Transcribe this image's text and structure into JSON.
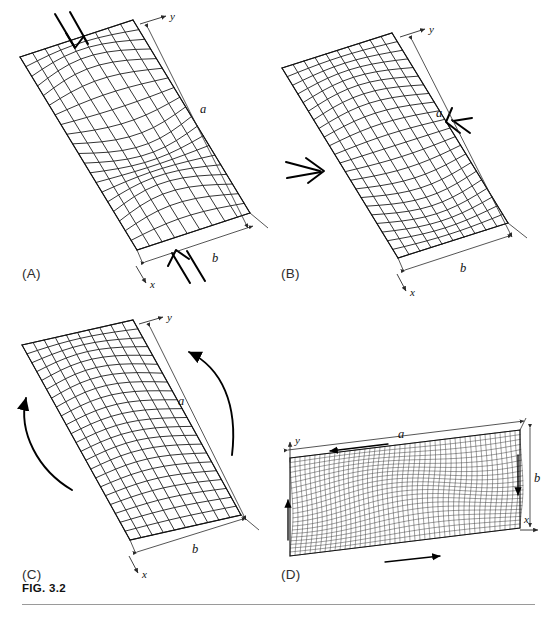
{
  "figure": {
    "caption": "FIG. 3.2",
    "width": 545,
    "height": 618,
    "background": "#ffffff",
    "ink_color": "#111111"
  },
  "panels": [
    {
      "id": "A",
      "tag": "(A)",
      "load_type": "uniaxial-compression",
      "description": "Plate buckling under longitudinal compression with multiple half-waves",
      "dimension_labels": {
        "long_side": "a",
        "short_side": "b"
      },
      "axis_labels": {
        "horizontal": "x",
        "vertical": "y"
      },
      "arrows": [
        {
          "name": "top-compression-arrow",
          "direction": "down-right",
          "style": "double-line"
        },
        {
          "name": "bottom-compression-arrow",
          "direction": "up-left",
          "style": "double-line"
        }
      ],
      "mesh": {
        "cols": 9,
        "rows": 20,
        "halfwaves": 3,
        "amplitude": 13,
        "weight": "medium"
      }
    },
    {
      "id": "B",
      "tag": "(B)",
      "load_type": "transverse-compression",
      "description": "Plate buckling under transverse compression across the width",
      "dimension_labels": {
        "long_side": "a",
        "short_side": "b"
      },
      "axis_labels": {
        "horizontal": "x",
        "vertical": "y"
      },
      "arrows": [
        {
          "name": "left-compression-arrow",
          "direction": "right",
          "style": "double-line"
        },
        {
          "name": "right-compression-arrow",
          "direction": "left",
          "style": "double-line"
        }
      ],
      "mesh": {
        "cols": 10,
        "rows": 22,
        "halfwaves": 2,
        "amplitude": 10,
        "weight": "medium"
      }
    },
    {
      "id": "C",
      "tag": "(C)",
      "load_type": "bending-moment",
      "description": "Plate buckling under in-plane bending with moment couples",
      "dimension_labels": {
        "long_side": "a",
        "short_side": "b"
      },
      "axis_labels": {
        "horizontal": "x",
        "vertical": "y"
      },
      "arrows": [
        {
          "name": "left-moment-arrow",
          "direction": "curved-up",
          "style": "curved"
        },
        {
          "name": "right-moment-arrow",
          "direction": "curved-up-left",
          "style": "curved"
        }
      ],
      "mesh": {
        "cols": 10,
        "rows": 22,
        "halfwaves": 1,
        "amplitude": 9,
        "weight": "medium"
      }
    },
    {
      "id": "D",
      "tag": "(D)",
      "load_type": "shear",
      "description": "Plate buckling under pure shear with inclined diagonal waves",
      "dimension_labels": {
        "long_side": "a",
        "short_side": "b"
      },
      "axis_labels": {
        "horizontal": "x",
        "vertical": "y"
      },
      "arrows": [
        {
          "name": "top-shear-arrow",
          "direction": "left",
          "style": "thin"
        },
        {
          "name": "bottom-shear-arrow",
          "direction": "right",
          "style": "thin"
        },
        {
          "name": "left-shear-arrow",
          "direction": "up",
          "style": "thin"
        },
        {
          "name": "right-shear-arrow",
          "direction": "down",
          "style": "thin"
        }
      ],
      "mesh": {
        "cols": 46,
        "rows": 22,
        "halfwaves": 2,
        "amplitude": 7,
        "weight": "fine"
      }
    }
  ]
}
